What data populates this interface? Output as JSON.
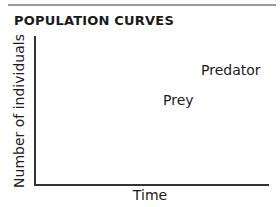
{
  "figure": {
    "title": "POPULATION CURVES",
    "y_axis_label": "Number of individuals",
    "x_axis_label": "Time",
    "labels": {
      "predator": "Predator",
      "prey": "Prey"
    },
    "colors": {
      "axis": "#333333",
      "rule": "#9a9a9a",
      "text": "#1a1a1a"
    }
  }
}
